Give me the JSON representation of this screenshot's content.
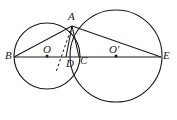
{
  "figure": {
    "type": "euclidean-geometry-diagram",
    "canvas": {
      "width": 177,
      "height": 120,
      "background": "#ffffff"
    },
    "stroke_color": "#1a1a1a",
    "label_color": "#1a1a1a"
  },
  "points": [
    {
      "id": "B",
      "label": "B",
      "x": 14,
      "y": 57,
      "label_x": 5,
      "label_y": 50,
      "dot": false
    },
    {
      "id": "O",
      "label": "O",
      "x": 47,
      "y": 56,
      "label_x": 43,
      "label_y": 44,
      "dot": true
    },
    {
      "id": "D",
      "label": "D",
      "x": 66,
      "y": 57,
      "label_x": 66,
      "label_y": 58,
      "dot": false
    },
    {
      "id": "C",
      "label": "C",
      "x": 79,
      "y": 57,
      "label_x": 80,
      "label_y": 55,
      "dot": false
    },
    {
      "id": "Op",
      "label": "O'",
      "x": 116,
      "y": 56,
      "label_x": 109,
      "label_y": 44,
      "dot": true
    },
    {
      "id": "E",
      "label": "E",
      "x": 161,
      "y": 57,
      "label_x": 163,
      "label_y": 50,
      "dot": false
    },
    {
      "id": "A",
      "label": "A",
      "x": 72,
      "y": 26,
      "label_x": 68,
      "label_y": 11,
      "dot": false
    }
  ],
  "circles": [
    {
      "id": "left-circle",
      "name": "circle-O",
      "cx": 47,
      "cy": 56,
      "r": 33
    },
    {
      "id": "right-circle",
      "name": "circle-O-prime",
      "cx": 116,
      "cy": 56,
      "r": 46
    }
  ],
  "segments": [
    {
      "id": "BE",
      "name": "segment-B-E",
      "x1": 14,
      "y1": 57,
      "x2": 161,
      "y2": 57,
      "style": "solid"
    },
    {
      "id": "BA",
      "name": "segment-B-A",
      "x1": 14,
      "y1": 57,
      "x2": 72,
      "y2": 26,
      "style": "solid"
    },
    {
      "id": "AE",
      "name": "segment-A-E",
      "x1": 72,
      "y1": 26,
      "x2": 161,
      "y2": 57,
      "style": "solid"
    },
    {
      "id": "AD",
      "name": "segment-A-D",
      "x1": 72,
      "y1": 26,
      "x2": 66,
      "y2": 57,
      "style": "solid"
    },
    {
      "id": "AC",
      "name": "segment-A-C",
      "x1": 72,
      "y1": 26,
      "x2": 79,
      "y2": 57,
      "style": "solid"
    }
  ],
  "dashed_segments": [
    {
      "id": "OD-ext",
      "name": "dashed-segment-through-D",
      "x1": 72,
      "y1": 26,
      "x2": 56,
      "y2": 72,
      "style": "dashed"
    }
  ],
  "labels_note": "Labels B, O, D, C, O prime, E lie on the horizontal line; A is the upper intersection of the two circles."
}
